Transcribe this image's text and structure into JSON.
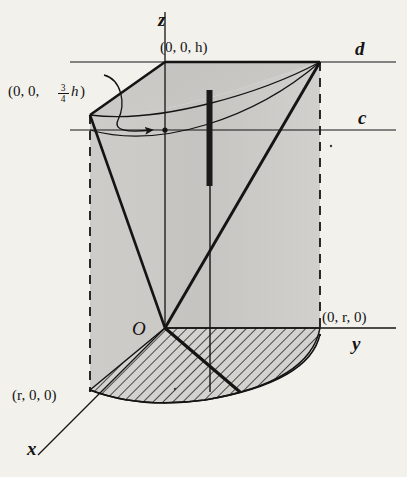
{
  "figure": {
    "background_color": "#f3f1ec",
    "ink_color": "#141414",
    "body_fill": "#c9c7c4",
    "side_fill": "#cfcdca",
    "hatch_fill": "#d2d0cd"
  },
  "axes": {
    "x_label": "x",
    "y_label": "y",
    "z_label": "z"
  },
  "guide_lines": {
    "d_label": "d",
    "c_label": "c"
  },
  "points": {
    "origin": "O",
    "top_z": "(0, 0, h)",
    "three_quarter_z_prefix": "(0, 0, ",
    "three_quarter_num": "3",
    "three_quarter_den": "4",
    "three_quarter_var": "h",
    "three_quarter_suffix": ")",
    "y_radius": "(0, r, 0)",
    "x_radius": "(r, 0, 0)"
  },
  "annotations": {
    "arrow_name": "pointer-from-three-quarter-label"
  }
}
